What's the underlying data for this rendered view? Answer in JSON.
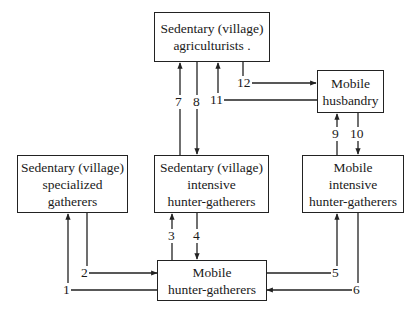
{
  "diagram": {
    "nodes": {
      "agriculturists": {
        "lines": [
          "Sedentary (village)",
          "agriculturists ."
        ]
      },
      "husbandry": {
        "lines": [
          "Mobile",
          "husbandry"
        ]
      },
      "specialized": {
        "lines": [
          "Sedentary (village)",
          "specialized",
          "gatherers"
        ]
      },
      "intensive_sedentary": {
        "lines": [
          "Sedentary (village)",
          "intensive",
          "hunter-gatherers"
        ]
      },
      "intensive_mobile": {
        "lines": [
          "Mobile",
          "intensive",
          "hunter-gatherers"
        ]
      },
      "mobile_hg": {
        "lines": [
          "Mobile",
          "hunter-gatherers"
        ]
      }
    },
    "edges": [
      {
        "label": "1",
        "from": "mobile_hg",
        "to": "specialized"
      },
      {
        "label": "2",
        "from": "specialized",
        "to": "mobile_hg"
      },
      {
        "label": "3",
        "from": "mobile_hg",
        "to": "intensive_sedentary"
      },
      {
        "label": "4",
        "from": "intensive_sedentary",
        "to": "mobile_hg"
      },
      {
        "label": "5",
        "from": "mobile_hg",
        "to": "intensive_mobile"
      },
      {
        "label": "6",
        "from": "intensive_mobile",
        "to": "mobile_hg"
      },
      {
        "label": "7",
        "from": "intensive_sedentary",
        "to": "agriculturists"
      },
      {
        "label": "8",
        "from": "agriculturists",
        "to": "intensive_sedentary"
      },
      {
        "label": "9",
        "from": "intensive_mobile",
        "to": "husbandry"
      },
      {
        "label": "10",
        "from": "husbandry",
        "to": "intensive_mobile"
      },
      {
        "label": "11",
        "from": "husbandry",
        "to": "agriculturists"
      },
      {
        "label": "12",
        "from": "agriculturists",
        "to": "husbandry"
      }
    ]
  }
}
